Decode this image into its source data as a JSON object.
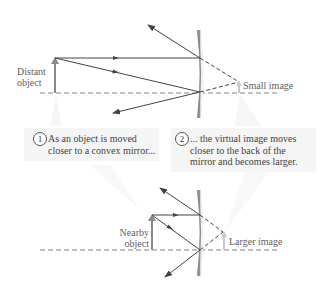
{
  "top_diagram": {
    "object_label_line1": "Distant",
    "object_label_line2": "object",
    "image_label": "Small image"
  },
  "bottom_diagram": {
    "object_label_line1": "Nearby",
    "object_label_line2": "object",
    "image_label": "Larger image"
  },
  "captions": [
    {
      "number": "1",
      "line1": "As an object is moved",
      "line2": "closer to a convex mirror...",
      "line3": ""
    },
    {
      "number": "2",
      "line1": "... the virtual image moves",
      "line2": "closer to the back of the",
      "line3": "mirror and becomes larger."
    }
  ],
  "colors": {
    "ray": "#444444",
    "mirror": "#9a9a9a",
    "arrow_object": "#8a8a8a",
    "caption_bg": "#f5f5f5"
  }
}
